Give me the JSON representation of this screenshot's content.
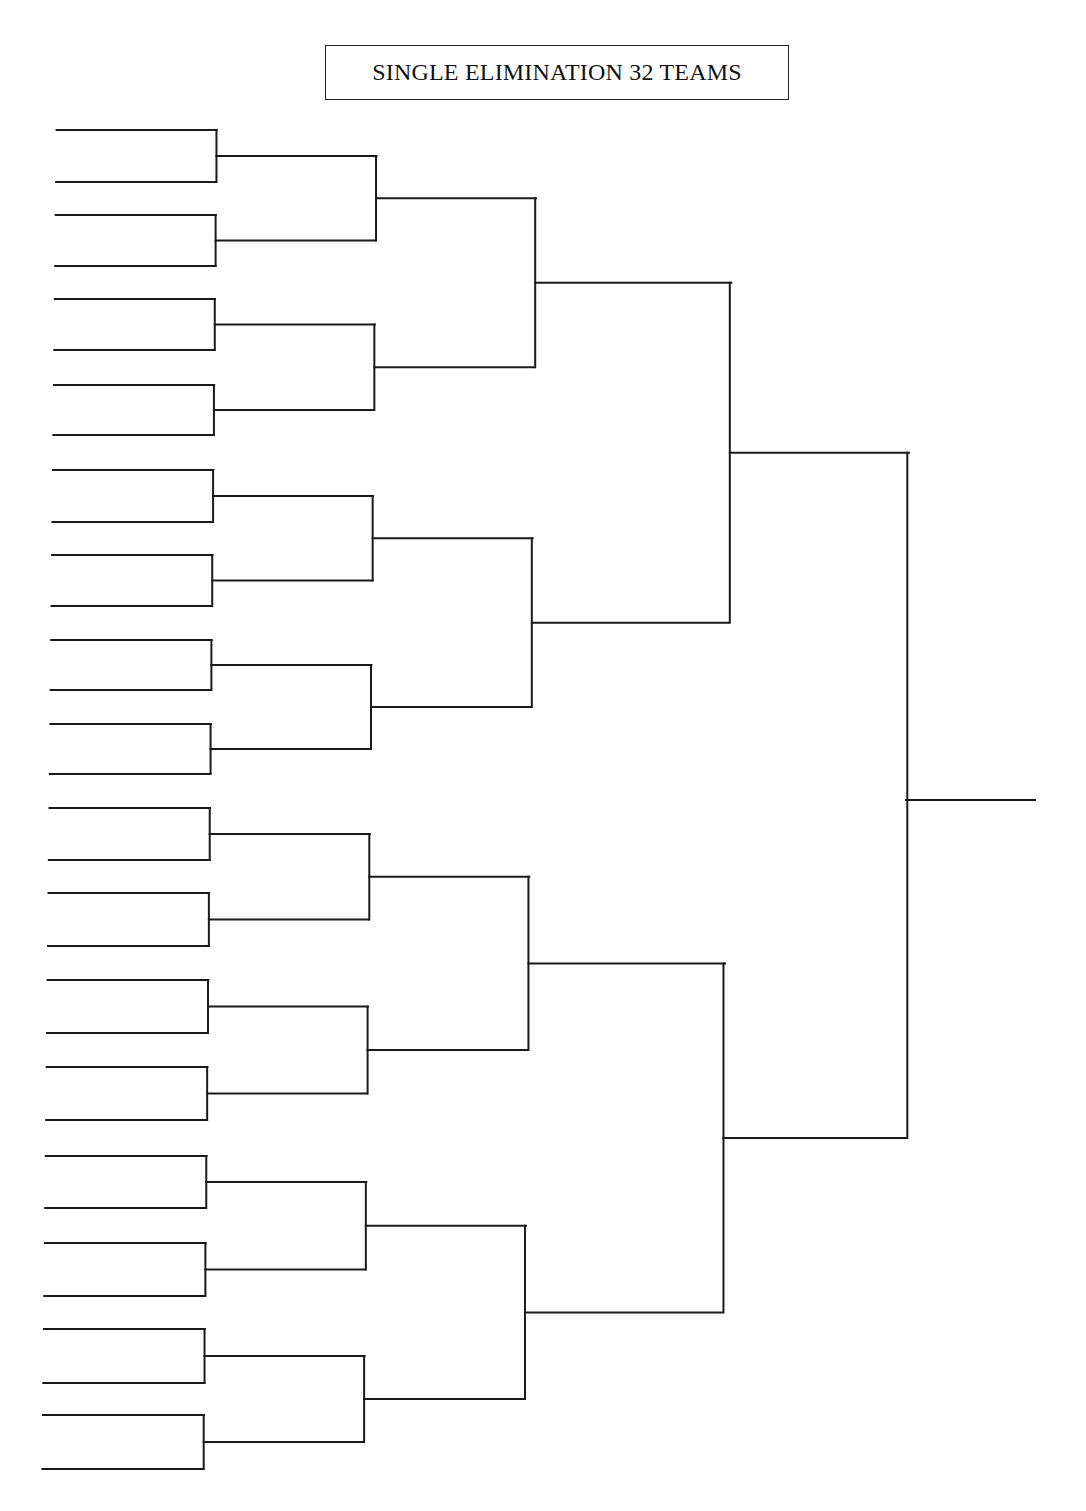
{
  "page": {
    "title": "SINGLE ELIMINATION 32 TEAMS",
    "line_color": "#1a1a1a",
    "background": "#ffffff"
  },
  "bracket": {
    "teams": 32,
    "rounds": 5,
    "round1": {
      "x_left_top": 58,
      "x_left_bottom": 42,
      "x_right_top": 218,
      "x_right_bottom": 203,
      "slot_y": [
        130,
        182,
        215,
        266,
        299,
        350,
        385,
        435,
        470,
        522,
        555,
        606,
        640,
        690,
        724,
        774,
        808,
        860,
        893,
        946,
        980,
        1033,
        1067,
        1120,
        1156,
        1208,
        1243,
        1296,
        1329,
        1383,
        1415,
        1469
      ]
    },
    "round2": {
      "x_right_top": 378,
      "x_right_bottom": 363
    },
    "round3": {
      "x_right_top": 538,
      "x_right_bottom": 523
    },
    "round4": {
      "x_right_top": 734,
      "x_right_bottom": 720
    },
    "round5": {
      "x_right_top": 911,
      "x_right_bottom": 904
    },
    "champion_line": {
      "x1": 906,
      "x2": 1035,
      "y": 800
    }
  }
}
